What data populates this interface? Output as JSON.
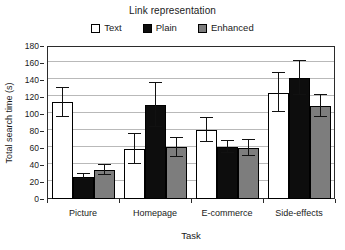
{
  "chart_data": {
    "type": "bar",
    "title": "Link representation",
    "xlabel": "Task",
    "ylabel": "Total search time (s)",
    "ylim": [
      0,
      180
    ],
    "ytick_step": 20,
    "yticks": [
      0,
      20,
      40,
      60,
      80,
      100,
      120,
      140,
      160,
      180
    ],
    "grid": true,
    "legend_position": "top-center",
    "categories": [
      "Picture",
      "Homepage",
      "E-commerce",
      "Side-effects"
    ],
    "series": [
      {
        "name": "Text",
        "color": "#ffffff",
        "values": [
          114,
          59,
          81,
          125
        ],
        "errors": [
          17,
          18,
          14,
          23
        ]
      },
      {
        "name": "Plain",
        "color": "#0d0d0d",
        "values": [
          26,
          111,
          61,
          142
        ],
        "errors": [
          3,
          26,
          7,
          20
        ]
      },
      {
        "name": "Enhanced",
        "color": "#7d7d7d",
        "values": [
          34,
          61,
          60,
          109
        ],
        "errors": [
          6,
          11,
          9,
          13
        ]
      }
    ]
  }
}
